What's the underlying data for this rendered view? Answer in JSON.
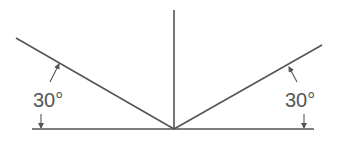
{
  "diagram": {
    "type": "angle-diagram",
    "colors": {
      "line": "#555555",
      "background": "#ffffff"
    },
    "vertex": {
      "x": 174,
      "y": 129
    },
    "lines": {
      "vertical": {
        "x1": 174,
        "y1": 10,
        "x2": 174,
        "y2": 129
      },
      "baseline": {
        "x1": 32,
        "y1": 129,
        "x2": 314,
        "y2": 129
      },
      "left_incline": {
        "x1": 16,
        "y1": 38,
        "x2": 174,
        "y2": 129
      },
      "right_incline": {
        "x1": 174,
        "y1": 129,
        "x2": 322,
        "y2": 45
      }
    },
    "annotations": [
      {
        "id": "left-angle",
        "label": "30°",
        "x": 33,
        "y": 107
      },
      {
        "id": "right-angle",
        "label": "30°",
        "x": 285,
        "y": 107
      }
    ]
  }
}
